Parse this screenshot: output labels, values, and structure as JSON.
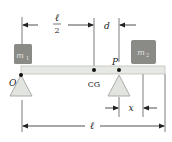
{
  "diagram": {
    "labels": {
      "half_length_num": "ℓ",
      "half_length_den": "2",
      "d": "d",
      "m1": "m",
      "m1_sub": "1",
      "m2": "m",
      "m2_sub": "2",
      "O": "O",
      "CG": "CG",
      "P": "P",
      "x": "x",
      "length": "ℓ"
    },
    "colors": {
      "beam": "#e6e8e4",
      "beam_border": "#b8bab6",
      "mass_box": "#8a8a86",
      "mass_text": "#dcdcd8",
      "support": "#e2e4e0",
      "support_border": "#9a9c98",
      "line": "#222222"
    }
  }
}
